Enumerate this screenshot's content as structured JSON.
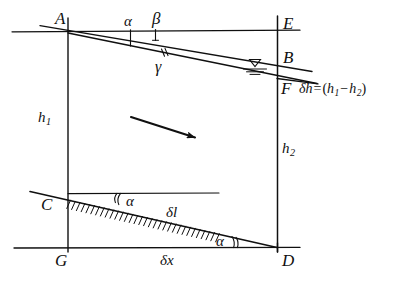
{
  "figure": {
    "background_color": "#ffffff",
    "ink_color": "#101010",
    "width": 417,
    "height": 282
  },
  "points": {
    "A": "A",
    "B": "B",
    "C": "C",
    "D": "D",
    "E": "E",
    "F": "F",
    "G": "G"
  },
  "angles": {
    "alpha_top": "α",
    "beta": "β",
    "gamma": "γ",
    "alpha_bed_upper": "α",
    "alpha_bed_lower": "α"
  },
  "depths": {
    "h1": {
      "base": "h",
      "sub": "1"
    },
    "h2": {
      "base": "h",
      "sub": "2"
    }
  },
  "lengths": {
    "delta_l": "δl",
    "delta_x": "δx"
  },
  "formula": {
    "lhs": "δh",
    "equals": "=",
    "open_paren": "(",
    "h1_base": "h",
    "h1_sub": "1",
    "minus": "−",
    "h2_base": "h",
    "h2_sub": "2",
    "close_paren": ")"
  },
  "icons": {
    "flow_arrow": "flow-direction-arrow-icon",
    "water_surface": "water-surface-level-icon",
    "channel_bed_hatching": "channel-bed-hatching-icon"
  },
  "geometry": {
    "left_vertical_x": 68,
    "right_vertical_x": 277,
    "top_horizontal_y": 31,
    "bottom_horizontal_y": 248,
    "point_B_y": 62,
    "point_F_y": 88,
    "point_C_y": 199,
    "point_D_y": 248
  }
}
